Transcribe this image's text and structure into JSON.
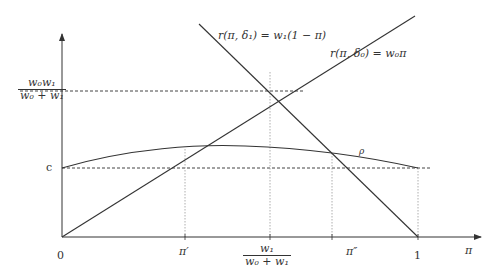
{
  "figure": {
    "axes": {
      "x_axis_label": "π",
      "y_axis_ticks": [
        {
          "label_num": "w₀w₁",
          "label_den": "w₀ + w₁"
        },
        {
          "label": "c"
        }
      ],
      "x_axis_ticks": [
        {
          "label": "0"
        },
        {
          "label": "π′"
        },
        {
          "label_num": "w₁",
          "label_den": "w₀ + w₁"
        },
        {
          "label": "π″"
        },
        {
          "label": "1"
        }
      ]
    },
    "curves": {
      "line_delta1": {
        "label": "r(π, δ₁) = w₁(1 − π)"
      },
      "line_delta0": {
        "label": "r(π, δ₀) = w₀π"
      },
      "rho_curve": {
        "label": "ρ"
      }
    },
    "colors": {
      "line": "#333333",
      "dashed": "#444444",
      "dotted": "#888888"
    }
  }
}
